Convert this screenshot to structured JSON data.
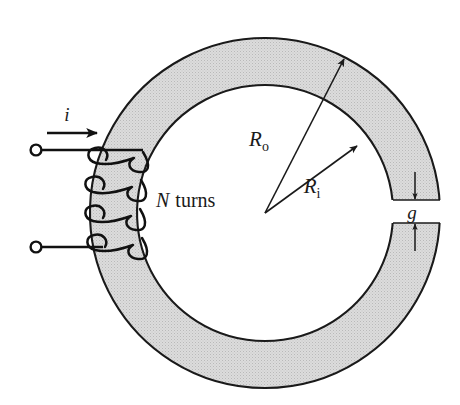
{
  "figure": {
    "labels": {
      "current": "i",
      "turns_symbol": "N",
      "turns_word": "turns",
      "outer_radius": "R",
      "outer_radius_sub": "o",
      "inner_radius": "R",
      "inner_radius_sub": "i",
      "gap": "g"
    },
    "colors": {
      "core_fill": "#d6d6d6",
      "stroke": "#1a1a1a",
      "wire": "#111111",
      "background": "#ffffff"
    },
    "geometry": {
      "center_x": 265,
      "center_y": 213,
      "outer_radius": 175,
      "inner_radius": 128,
      "gap_top_y": 200,
      "gap_bottom_y": 223,
      "coil_turns": 4,
      "terminal_top_x": 37,
      "terminal_top_y": 150,
      "terminal_bottom_x": 37,
      "terminal_bottom_y": 247
    }
  }
}
